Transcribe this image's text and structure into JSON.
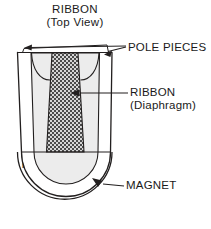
{
  "figure": {
    "title": {
      "line1": "RIBBON",
      "line2": "(Top View)"
    },
    "labels": {
      "pole_pieces": "POLE PIECES",
      "ribbon_line1": "RIBBON",
      "ribbon_line2": "(Diaphragm)",
      "magnet": "MAGNET",
      "north_pole": "N",
      "south_pole": "S"
    },
    "colors": {
      "line": "#221f1f",
      "background": "#ffffff",
      "body_fill": "#ffffff",
      "cavity_fill": "#ececec",
      "ribbon_dark": "#4a4a4a",
      "ribbon_light": "#d9d9d9"
    },
    "icons": {
      "pole_pieces_leader": "leader-arrow-double",
      "ribbon_leader": "leader-arrow-left",
      "magnet_leader": "leader-arrow-up-left"
    }
  }
}
